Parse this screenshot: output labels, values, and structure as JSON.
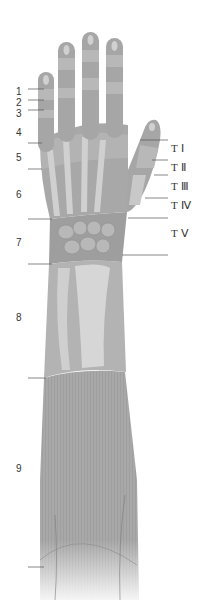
{
  "diagram": {
    "colors": {
      "skin": "#a6a6a6",
      "skin_light": "#bdbdbd",
      "bone": "#d2d2d2",
      "band": "#c4c4c4",
      "leader_line": "#555555",
      "label_text": "#333333"
    },
    "left_labels": [
      {
        "text": "1",
        "x": 16,
        "y": 87,
        "line_y": 89
      },
      {
        "text": "2",
        "x": 16,
        "y": 99,
        "line_y": 100
      },
      {
        "text": "3",
        "x": 16,
        "y": 110,
        "line_y": 110
      },
      {
        "text": "4",
        "x": 16,
        "y": 128,
        "line_y": 143
      },
      {
        "text": "5",
        "x": 16,
        "y": 153,
        "line_y": 169
      },
      {
        "text": "6",
        "x": 16,
        "y": 190,
        "line_y": 219
      },
      {
        "text": "7",
        "x": 16,
        "y": 238,
        "line_y": 264
      },
      {
        "text": "8",
        "x": 16,
        "y": 313,
        "line_y": 378
      },
      {
        "text": "9",
        "x": 16,
        "y": 464,
        "line_y": 567
      }
    ],
    "right_labels": [
      {
        "text": "T Ⅰ",
        "x": 171,
        "y": 143,
        "line_y": 140
      },
      {
        "text": "T Ⅱ",
        "x": 171,
        "y": 162,
        "line_y": 160
      },
      {
        "text": "T Ⅲ",
        "x": 171,
        "y": 181,
        "line_y": 175
      },
      {
        "text": "T Ⅳ",
        "x": 171,
        "y": 200,
        "line_y": 198
      },
      {
        "text": "T Ⅴ",
        "x": 171,
        "y": 228,
        "line_y": 218
      }
    ]
  }
}
